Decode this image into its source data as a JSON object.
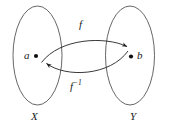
{
  "figure": {
    "background_color": "#ffffff",
    "stroke_color": "#555555",
    "arrow_color": "#222222",
    "dot_color": "#111111"
  },
  "sets": {
    "domain": {
      "label": "X",
      "element_label": "a"
    },
    "codomain": {
      "label": "Y",
      "element_label": "b"
    }
  },
  "maps": {
    "forward": {
      "label": "f",
      "direction": "a-to-b"
    },
    "inverse": {
      "label_base": "f",
      "label_exponent": "−1",
      "direction": "b-to-a"
    }
  }
}
